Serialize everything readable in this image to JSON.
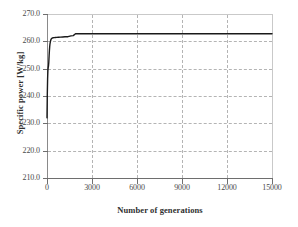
{
  "chart_data": {
    "type": "line",
    "title": "",
    "xlabel": "Number of generations",
    "ylabel": "Specific power [W/kg]",
    "xlim": [
      0,
      15000
    ],
    "ylim": [
      210.0,
      270.0
    ],
    "xticks": [
      0,
      3000,
      6000,
      9000,
      12000,
      15000
    ],
    "yticks": [
      210.0,
      220.0,
      230.0,
      240.0,
      250.0,
      260.0,
      270.0
    ],
    "xtick_labels": [
      "0",
      "3000",
      "6000",
      "9000",
      "12000",
      "15000"
    ],
    "ytick_labels": [
      "270.0",
      "260.0",
      "250.0",
      "240.0",
      "230.0",
      "220.0",
      "210.0"
    ],
    "grid": "dashed both axes",
    "legend": "none",
    "series": [
      {
        "name": "Specific power",
        "color": "#1a1a1a",
        "x": [
          0,
          20,
          40,
          60,
          80,
          100,
          120,
          140,
          160,
          180,
          200,
          230,
          260,
          300,
          350,
          400,
          480,
          560,
          650,
          760,
          900,
          1050,
          1200,
          1400,
          1600,
          1750,
          1900,
          2100,
          2400,
          2800,
          3400,
          4200,
          5200,
          6400,
          7800,
          9200,
          10600,
          12000,
          13400,
          15000
        ],
        "y": [
          232.0,
          240.5,
          246.2,
          249.3,
          250.4,
          251.0,
          252.4,
          254.6,
          256.6,
          258.0,
          259.1,
          260.0,
          260.6,
          261.0,
          261.2,
          261.3,
          261.35,
          261.4,
          261.45,
          261.5,
          261.55,
          261.6,
          261.65,
          261.7,
          262.0,
          262.1,
          262.75,
          262.8,
          262.8,
          262.8,
          262.8,
          262.8,
          262.8,
          262.8,
          262.8,
          262.8,
          262.8,
          262.8,
          262.8,
          262.8
        ]
      }
    ]
  },
  "axes": {
    "y_labels": [
      "270.0",
      "260.0",
      "250.0",
      "240.0",
      "230.0",
      "220.0",
      "210.0"
    ],
    "x_labels": [
      "0",
      "3000",
      "6000",
      "9000",
      "12000",
      "15000"
    ],
    "x_title": "Number of generations",
    "y_title": "Specific power [W/kg]"
  },
  "style": {
    "line_color": "#1a1a1a",
    "grid_color": "#b4b4b4",
    "axis_color": "#6e6e6e",
    "text_color": "#4a4a4a",
    "background": "#ffffff"
  }
}
